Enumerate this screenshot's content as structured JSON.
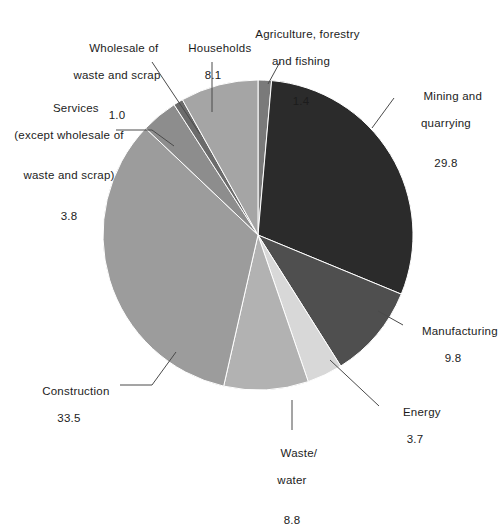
{
  "chart_data": {
    "type": "pie",
    "title": "",
    "subtitle": "",
    "xlabel": "",
    "ylabel": "",
    "units": "percent",
    "legend_position": "none",
    "grid": false,
    "start_angle_deg": 0,
    "direction": "clockwise",
    "total": 99.9,
    "categories": [
      "Agriculture, forestry and fishing",
      "Mining and quarrying",
      "Manufacturing",
      "Energy",
      "Waste/water",
      "Construction",
      "Services (except wholesale of waste and scrap)",
      "Wholesale of waste and scrap",
      "Households"
    ],
    "values": [
      1.4,
      29.8,
      9.8,
      3.7,
      8.8,
      33.5,
      3.8,
      1.0,
      8.1
    ],
    "colors": [
      "#7a7a7a",
      "#2b2b2b",
      "#4f4f4f",
      "#d8d8d8",
      "#b2b2b2",
      "#9c9c9c",
      "#8d8d8d",
      "#6b6b6b",
      "#a5a5a5"
    ],
    "slices": [
      {
        "label": "Agriculture, forestry and fishing",
        "value": 1.4,
        "color": "#7a7a7a"
      },
      {
        "label": "Mining and quarrying",
        "value": 29.8,
        "color": "#2b2b2b"
      },
      {
        "label": "Manufacturing",
        "value": 9.8,
        "color": "#4f4f4f"
      },
      {
        "label": "Energy",
        "value": 3.7,
        "color": "#d8d8d8"
      },
      {
        "label": "Waste/water",
        "value": 8.8,
        "color": "#b2b2b2"
      },
      {
        "label": "Construction",
        "value": 33.5,
        "color": "#9c9c9c"
      },
      {
        "label": "Services (except wholesale of waste and scrap)",
        "value": 3.8,
        "color": "#8d8d8d"
      },
      {
        "label": "Wholesale of waste and scrap",
        "value": 1.0,
        "color": "#6b6b6b"
      },
      {
        "label": "Households",
        "value": 8.1,
        "color": "#a5a5a5"
      }
    ]
  },
  "labels": {
    "households": {
      "line1": "Households",
      "value": "8.1"
    },
    "agriculture": {
      "line1": "Agriculture, forestry",
      "line2": "and fishing",
      "value": "1.4"
    },
    "mining": {
      "line1": "Mining and",
      "line2": "quarrying",
      "value": "29.8"
    },
    "manufacturing": {
      "line1": "Manufacturing",
      "value": "9.8"
    },
    "energy": {
      "line1": "Energy",
      "value": "3.7"
    },
    "waste_water": {
      "line1": "Waste/",
      "line2": "water",
      "value": "8.8"
    },
    "construction": {
      "line1": "Construction",
      "value": "33.5"
    },
    "services": {
      "line1": "Services",
      "line2": "(except wholesale of",
      "line3": "waste and scrap)",
      "value": "3.8"
    },
    "wholesale": {
      "line1": "Wholesale of",
      "line2": "waste and scrap",
      "value": "1.0"
    }
  },
  "geometry": {
    "center_x": 258,
    "center_y": 235,
    "radius": 155
  }
}
